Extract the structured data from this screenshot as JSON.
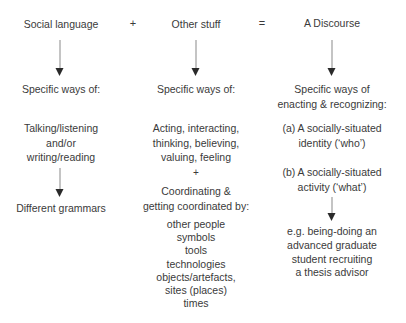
{
  "equation": {
    "term1": "Social language",
    "plus": "+",
    "term2": "Other stuff",
    "equals": "=",
    "result": "A Discourse"
  },
  "columns": {
    "social_language": {
      "ways_label": "Specific ways of:",
      "modes": [
        "Talking/listening",
        "and/or",
        "writing/reading"
      ],
      "outcome": "Different grammars"
    },
    "other_stuff": {
      "ways_label": "Specific ways of:",
      "activities": [
        "Acting, interacting,",
        "thinking, believing,",
        "valuing, feeling"
      ],
      "plus": "+",
      "coordinating": [
        "Coordinating &",
        "getting coordinated by:"
      ],
      "coordinated_by": [
        "other people",
        "symbols",
        "tools",
        "technologies",
        "objects/artefacts,",
        "sites (places)",
        "times"
      ]
    },
    "discourse": {
      "ways_label": [
        "Specific ways of",
        "enacting & recognizing:"
      ],
      "identity": [
        "(a) A socially-situated",
        "identity (‘who’)"
      ],
      "activity": [
        "(b) A socially-situated",
        "activity (‘what’)"
      ],
      "example": [
        "e.g. being-doing an",
        "advanced graduate",
        "student recruiting",
        "a thesis advisor"
      ]
    }
  }
}
